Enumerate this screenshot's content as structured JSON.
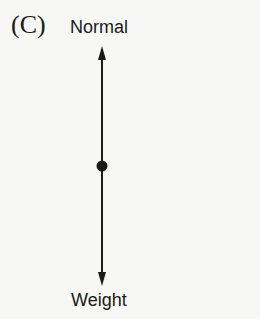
{
  "figure": {
    "panel_label": "(C)",
    "forces": [
      {
        "name": "Normal",
        "direction": "up"
      },
      {
        "name": "Weight",
        "direction": "down"
      }
    ],
    "colors": {
      "ink": "#1a1a1a",
      "background": "#f7f7f5"
    }
  }
}
